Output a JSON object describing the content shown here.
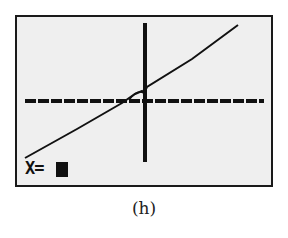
{
  "calculator_screen": {
    "prompt_label": "X=",
    "cursor": "block-cursor",
    "axes": {
      "x_axis": "horizontal-axis-with-ticks",
      "y_axis": "vertical-axis"
    },
    "plotted_line": "increasing-line"
  },
  "caption": "(h)",
  "colors": {
    "screen_bg": "#efefef",
    "ink": "#111111",
    "border": "#1a1a1a"
  }
}
